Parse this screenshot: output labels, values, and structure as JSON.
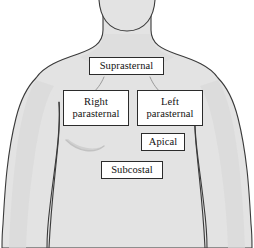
{
  "figure": {
    "background_color": "#ffffff",
    "body_fill_color": "#e3e3e3",
    "body_outline_color": "#3a3a3a",
    "label_box_fill": "#ffffff",
    "label_box_border": "#2b2b2b",
    "label_text_color": "#111111"
  },
  "anatomy": {
    "figure_name": "anterior-torso",
    "parts": [
      {
        "name": "head-chin",
        "label": "chin"
      },
      {
        "name": "neck",
        "label": "neck"
      },
      {
        "name": "left-shoulder",
        "label": "shoulder"
      },
      {
        "name": "right-shoulder",
        "label": "shoulder"
      },
      {
        "name": "chest",
        "label": "chest"
      },
      {
        "name": "left-arm",
        "label": "arm"
      },
      {
        "name": "right-arm",
        "label": "arm"
      },
      {
        "name": "clavicle-crease-left",
        "label": "clavicle"
      },
      {
        "name": "clavicle-crease-right",
        "label": "clavicle"
      },
      {
        "name": "pectoral-crease",
        "label": "pectoral fold"
      }
    ]
  },
  "labels": {
    "suprasternal": "Suprasternal",
    "right_parasternal": "Right\nparasternal",
    "left_parasternal": "Left\nparasternal",
    "apical": "Apical",
    "subcostal": "Subcostal"
  }
}
